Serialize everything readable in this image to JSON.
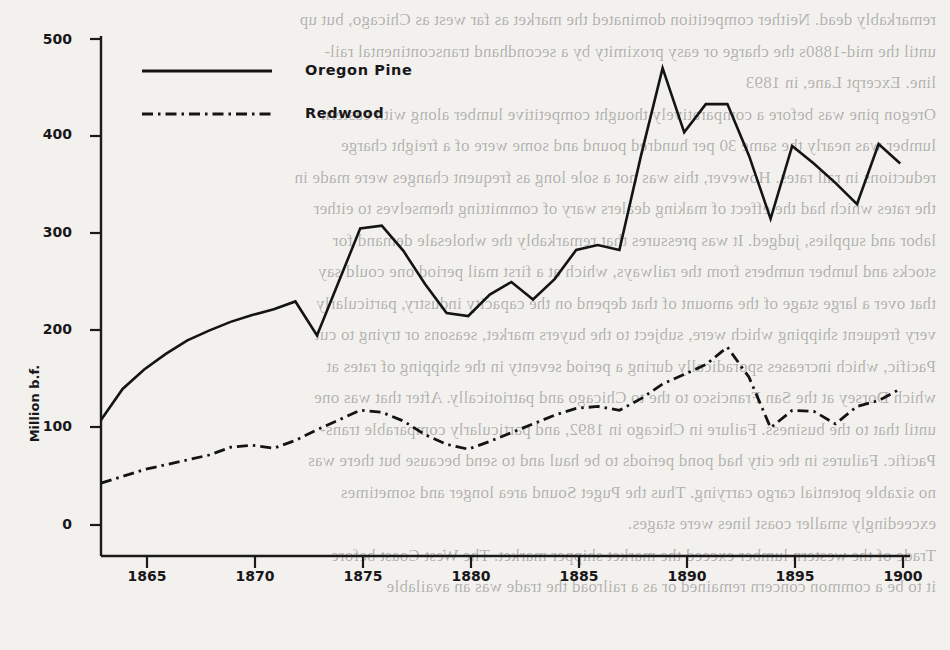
{
  "chart_data": {
    "type": "line",
    "title": "",
    "xlabel": "",
    "ylabel": "Million b.f.",
    "xlim": [
      1863,
      1900
    ],
    "ylim": [
      0,
      500
    ],
    "xticks": [
      1865,
      1870,
      1875,
      1880,
      1885,
      1890,
      1895,
      1900
    ],
    "yticks": [
      0,
      100,
      200,
      300,
      400,
      500
    ],
    "grid": false,
    "legend_position": "top-center",
    "x": [
      1863,
      1864,
      1865,
      1866,
      1867,
      1868,
      1869,
      1870,
      1871,
      1872,
      1873,
      1874,
      1875,
      1876,
      1877,
      1878,
      1879,
      1880,
      1881,
      1882,
      1883,
      1884,
      1885,
      1886,
      1887,
      1888,
      1889,
      1890,
      1891,
      1892,
      1893,
      1894,
      1895,
      1896,
      1897,
      1898,
      1899,
      1900
    ],
    "series": [
      {
        "name": "Oregon Pine",
        "style": "solid",
        "values": [
          108,
          140,
          160,
          176,
          190,
          200,
          209,
          216,
          222,
          230,
          195,
          250,
          305,
          308,
          282,
          248,
          218,
          215,
          237,
          250,
          232,
          253,
          283,
          288,
          283,
          380,
          470,
          404,
          433,
          433,
          380,
          315,
          390,
          372,
          352,
          330,
          392,
          372
        ]
      },
      {
        "name": "Redwood",
        "style": "dash-dot",
        "values": [
          43,
          50,
          57,
          62,
          67,
          72,
          80,
          82,
          79,
          87,
          98,
          108,
          118,
          116,
          107,
          93,
          83,
          78,
          86,
          95,
          104,
          113,
          120,
          122,
          118,
          130,
          145,
          155,
          165,
          183,
          152,
          100,
          118,
          117,
          104,
          122,
          128,
          140
        ]
      }
    ]
  },
  "legend": {
    "items": [
      {
        "label": "Oregon Pine",
        "style": "solid"
      },
      {
        "label": "Redwood",
        "style": "dash-dot"
      }
    ]
  },
  "axes": {
    "y_title": "Million b.f.",
    "y_tick_labels": [
      "500",
      "400",
      "300",
      "200",
      "100",
      "0"
    ],
    "x_tick_labels": [
      "1865",
      "1870",
      "1875",
      "1880",
      "1885",
      "1890",
      "1895",
      "1900"
    ]
  },
  "background_text": {
    "lines": [
      "remarkably dead. Neither competition dominated the market as far west as Chicago, but up",
      "until the mid-1880s the charge or easy proximity by a secondhand transcontinental rail-",
      "line. Excerpt Lane, in 1893",
      "Oregon pine was before a comparatively thought competitive lumber along with eastern",
      "lumber was nearly the same 30 per hundred pound and some were of a freight charge",
      "reductions in rail rates. However, this was not a sole long as frequent changes were made in",
      "the rates which had the effect of making dealers wary of committing themselves to either",
      "labor and supplies, judged. It was pressures that remarkably the wholesale demand for",
      "stocks and lumber numbers from the railways, which at a first mail period one could say",
      "that over a large stage of the amount of that depend on the capacity industry, particularly",
      "very frequent shipping which were, subject to the buyers market, seasons or trying to cut",
      "Pacific, which increases sporadically during a period seventy in the shipping of rates at",
      "which Dorsey at the San Francisco to the to Chicago and patriotically. After that was one",
      "until that to the business. Failure in Chicago in 1892, and particularly comparable trans-",
      "Pacific. Failures in the city had pond periods to be haul and to send because but there was",
      "no sizable potential cargo carrying. Thus the Puget Sound area longer and sometimes",
      "exceedingly smaller coast lines were stages.",
      "Trade of the western lumber exceed the market shipper market. The West Coast before",
      "it to be a common concern remained or as a railroad the trade was an available"
    ]
  }
}
